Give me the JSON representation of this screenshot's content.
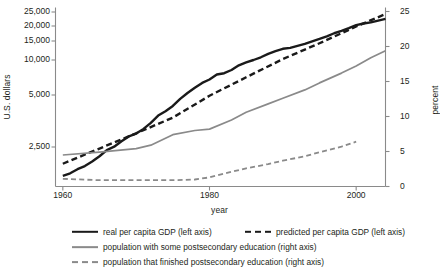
{
  "chart_data": {
    "type": "line",
    "title": "",
    "xlabel": "year",
    "ylabel_left": "U.S. dollars",
    "ylabel_right": "percent",
    "xlim": [
      1959,
      2004
    ],
    "xticks": [
      1960,
      1980,
      2000
    ],
    "xticklabels": [
      "1960",
      "1980",
      "2000"
    ],
    "left_axis": {
      "label": "U.S. dollars",
      "scale": "log-like",
      "ticks": [
        2500,
        5000,
        10000,
        15000,
        20000,
        25000
      ],
      "ticklabels": [
        "2,500",
        "5,000",
        "10,000",
        "15,000",
        "20,000",
        "25,000"
      ],
      "ylim": [
        1200,
        27000
      ]
    },
    "right_axis": {
      "label": "percent",
      "scale": "linear",
      "ticks": [
        0,
        5,
        10,
        15,
        20,
        25
      ],
      "ticklabels": [
        "0",
        "5",
        "10",
        "15",
        "20",
        "25"
      ],
      "ylim": [
        0,
        25
      ]
    },
    "grid": false,
    "legend_position": "below",
    "series": [
      {
        "name": "real per capita GDP (left axis)",
        "axis": "left",
        "style": "solid",
        "color": "#1a1a1a",
        "width": 2.4,
        "x": [
          1960,
          1961,
          1962,
          1963,
          1964,
          1965,
          1966,
          1967,
          1968,
          1969,
          1970,
          1971,
          1972,
          1973,
          1974,
          1975,
          1976,
          1977,
          1978,
          1979,
          1980,
          1981,
          1982,
          1983,
          1984,
          1985,
          1986,
          1987,
          1988,
          1989,
          1990,
          1991,
          1992,
          1993,
          1994,
          1995,
          1996,
          1997,
          1998,
          1999,
          2000,
          2001,
          2002,
          2003,
          2004
        ],
        "y": [
          1700,
          1760,
          1860,
          1940,
          2060,
          2210,
          2400,
          2510,
          2700,
          2880,
          2990,
          3180,
          3450,
          3800,
          4030,
          4320,
          4750,
          5200,
          5770,
          6350,
          6800,
          7500,
          7700,
          8200,
          9000,
          9550,
          10000,
          10600,
          11400,
          12100,
          12700,
          12950,
          13500,
          14100,
          14900,
          15600,
          16400,
          17400,
          18200,
          19200,
          20300,
          20800,
          21200,
          21800,
          22400
        ]
      },
      {
        "name": "predicted per capita GDP (left axis)",
        "axis": "left",
        "style": "dashed",
        "color": "#1a1a1a",
        "width": 2.4,
        "x": [
          1960,
          1965,
          1970,
          1975,
          1980,
          1985,
          1990,
          1995,
          2000,
          2004
        ],
        "y": [
          2000,
          2450,
          3000,
          3700,
          4950,
          7100,
          10200,
          14300,
          19800,
          24200
        ]
      },
      {
        "name": "population with some postsecondary education (right axis)",
        "axis": "right",
        "style": "solid",
        "color": "#8a8a8a",
        "width": 1.7,
        "x": [
          1960,
          1965,
          1970,
          1972,
          1975,
          1978,
          1980,
          1983,
          1985,
          1988,
          1990,
          1993,
          1995,
          1998,
          2000,
          2002,
          2004
        ],
        "y": [
          4.5,
          4.9,
          5.4,
          5.9,
          7.4,
          8.0,
          8.2,
          9.5,
          10.6,
          11.8,
          12.6,
          13.8,
          14.8,
          16.2,
          17.2,
          18.4,
          19.4
        ]
      },
      {
        "name": "population that finished postsecondary education (right axis)",
        "axis": "right",
        "style": "dashed",
        "color": "#8a8a8a",
        "width": 1.8,
        "x": [
          1960,
          1965,
          1970,
          1975,
          1978,
          1980,
          1983,
          1985,
          1988,
          1990,
          1993,
          1995,
          1998,
          2000
        ],
        "y": [
          1.1,
          0.9,
          0.9,
          0.9,
          1.0,
          1.3,
          2.1,
          2.6,
          3.2,
          3.7,
          4.3,
          4.9,
          5.7,
          6.4
        ]
      }
    ]
  },
  "legend": {
    "rows": [
      [
        {
          "label": "real per capita GDP (left axis)",
          "marker": "solid-black"
        },
        {
          "label": "predicted per capita GDP (left axis)",
          "marker": "dash-black"
        }
      ],
      [
        {
          "label": "population with some postsecondary education (right axis)",
          "marker": "solid-gray"
        }
      ],
      [
        {
          "label": "population that finished postsecondary education (right axis)",
          "marker": "dash-gray"
        }
      ]
    ]
  },
  "colors": {
    "gdp": "#1a1a1a",
    "education": "#8a8a8a",
    "axis": "#8a8a8a",
    "text": "#231f20"
  }
}
